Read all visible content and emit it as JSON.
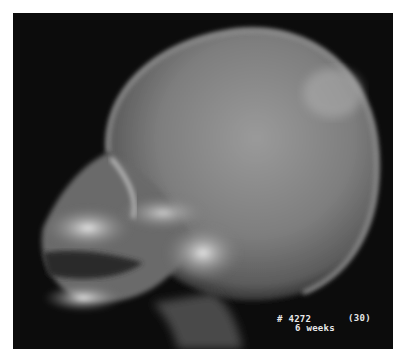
{
  "image": {
    "subject": "lateral skull x-ray of infant",
    "background_color": "#0c0c0c",
    "border_color": "#ffffff"
  },
  "labels": {
    "case_number": "# 4272",
    "plate_number": "(30)",
    "age": "6 weeks"
  }
}
